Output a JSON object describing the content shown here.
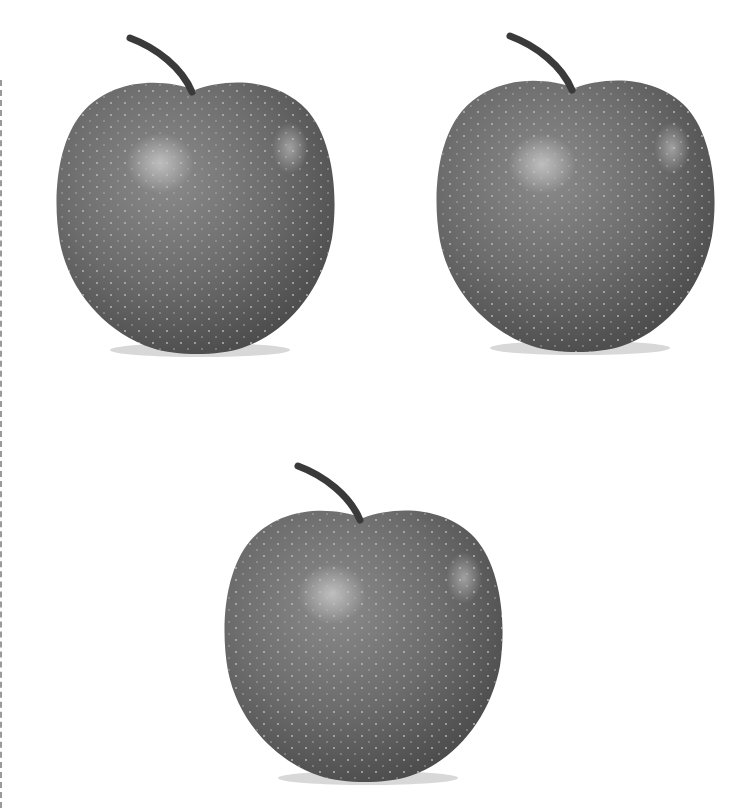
{
  "scene": {
    "background": "#ffffff",
    "description": "Three grayscale apples arranged in a triangle",
    "apples": [
      {
        "id": "apple-top-left",
        "x": 52,
        "y": 28,
        "w": 286,
        "h": 330
      },
      {
        "id": "apple-top-right",
        "x": 432,
        "y": 26,
        "w": 286,
        "h": 330
      },
      {
        "id": "apple-bottom-center",
        "x": 220,
        "y": 456,
        "w": 286,
        "h": 330
      }
    ],
    "colors": {
      "skin": "#6e6e6e",
      "skin_dark": "#4e4e4e",
      "highlight": "#b4b4b4",
      "stem": "#3a3a3a",
      "border": "#9a9a9a"
    }
  }
}
